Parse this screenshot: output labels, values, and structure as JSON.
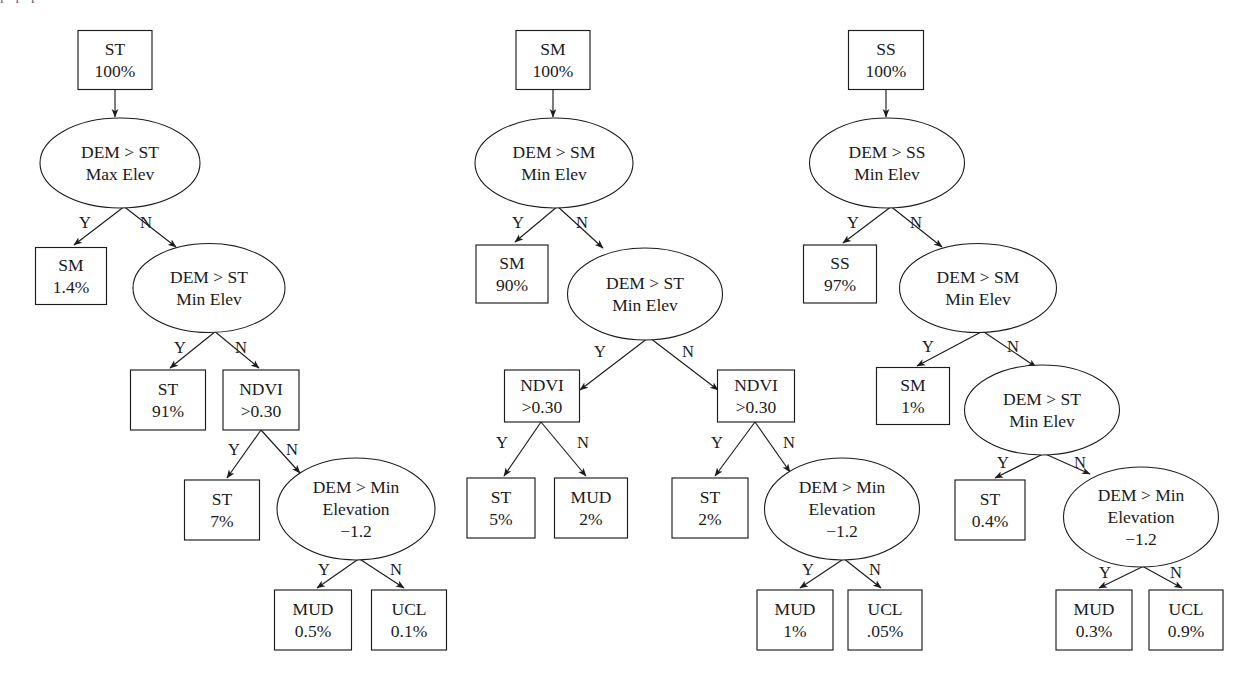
{
  "figure": {
    "clipped_header_text": "p            p                                 p",
    "colors": {
      "background": "#ffffff",
      "stroke": "#1c1c1c",
      "text": "#1a1a1a"
    }
  },
  "trees": [
    {
      "id": "tree-st",
      "root_label": "ST",
      "nodes": [
        {
          "id": "t1-n1",
          "shape": "rect",
          "line1": "ST",
          "line2": "100%",
          "line3": "",
          "cx": 115,
          "cy": 60,
          "w": 74,
          "h": 59
        },
        {
          "id": "t1-n2",
          "shape": "ellipse",
          "line1": "DEM > ST",
          "line2": "Max Elev",
          "line3": "",
          "cx": 120,
          "cy": 163,
          "w": 160,
          "h": 90
        },
        {
          "id": "t1-n3",
          "shape": "rect",
          "line1": "SM",
          "line2": "1.4%",
          "line3": "",
          "cx": 71,
          "cy": 276,
          "w": 71,
          "h": 57
        },
        {
          "id": "t1-n4",
          "shape": "ellipse",
          "line1": "DEM > ST",
          "line2": "Min Elev",
          "line3": "",
          "cx": 209,
          "cy": 288,
          "w": 152,
          "h": 89
        },
        {
          "id": "t1-n5",
          "shape": "rect",
          "line1": "ST",
          "line2": "91%",
          "line3": "",
          "cx": 168,
          "cy": 400,
          "w": 75,
          "h": 60
        },
        {
          "id": "t1-n6",
          "shape": "rect",
          "line1": "NDVI",
          "line2": ">0.30",
          "line3": "",
          "cx": 261,
          "cy": 400,
          "w": 76,
          "h": 60
        },
        {
          "id": "t1-n7",
          "shape": "rect",
          "line1": "ST",
          "line2": "7%",
          "line3": "",
          "cx": 222,
          "cy": 510,
          "w": 75,
          "h": 60
        },
        {
          "id": "t1-n8",
          "shape": "ellipse",
          "line1": "DEM > Min",
          "line2": "Elevation",
          "line3": "−1.2",
          "cx": 356,
          "cy": 509,
          "w": 158,
          "h": 102
        },
        {
          "id": "t1-n9",
          "shape": "rect",
          "line1": "MUD",
          "line2": "0.5%",
          "line3": "",
          "cx": 313,
          "cy": 620,
          "w": 77,
          "h": 60
        },
        {
          "id": "t1-n10",
          "shape": "rect",
          "line1": "UCL",
          "line2": "0.1%",
          "line3": "",
          "cx": 409,
          "cy": 620,
          "w": 75,
          "h": 60
        }
      ],
      "edges": [
        {
          "from": "t1-n1",
          "to": "t1-n2",
          "label": "",
          "x1": 115,
          "y1": 90,
          "x2": 115,
          "y2": 117,
          "lx": 0,
          "ly": 0
        },
        {
          "from": "t1-n2",
          "to": "t1-n3",
          "label": "Y",
          "x1": 125,
          "y1": 206,
          "x2": 74,
          "y2": 245,
          "lx": 85,
          "ly": 228
        },
        {
          "from": "t1-n2",
          "to": "t1-n4",
          "label": "N",
          "x1": 122,
          "y1": 205,
          "x2": 176,
          "y2": 247,
          "lx": 146,
          "ly": 228
        },
        {
          "from": "t1-n4",
          "to": "t1-n5",
          "label": "Y",
          "x1": 216,
          "y1": 331,
          "x2": 170,
          "y2": 368,
          "lx": 180,
          "ly": 353
        },
        {
          "from": "t1-n4",
          "to": "t1-n6",
          "label": "N",
          "x1": 213,
          "y1": 330,
          "x2": 259,
          "y2": 368,
          "lx": 241,
          "ly": 353
        },
        {
          "from": "t1-n6",
          "to": "t1-n7",
          "label": "Y",
          "x1": 261,
          "y1": 430,
          "x2": 227,
          "y2": 478,
          "lx": 234,
          "ly": 455
        },
        {
          "from": "t1-n6",
          "to": "t1-n8",
          "label": "N",
          "x1": 261,
          "y1": 430,
          "x2": 300,
          "y2": 473,
          "lx": 292,
          "ly": 455
        },
        {
          "from": "t1-n8",
          "to": "t1-n9",
          "label": "Y",
          "x1": 360,
          "y1": 558,
          "x2": 317,
          "y2": 588,
          "lx": 324,
          "ly": 575
        },
        {
          "from": "t1-n8",
          "to": "t1-n10",
          "label": "N",
          "x1": 358,
          "y1": 558,
          "x2": 404,
          "y2": 588,
          "lx": 396,
          "ly": 575
        }
      ]
    },
    {
      "id": "tree-sm",
      "root_label": "SM",
      "nodes": [
        {
          "id": "t2-n1",
          "shape": "rect",
          "line1": "SM",
          "line2": "100%",
          "line3": "",
          "cx": 553,
          "cy": 60,
          "w": 74,
          "h": 59
        },
        {
          "id": "t2-n2",
          "shape": "ellipse",
          "line1": "DEM > SM",
          "line2": "Min Elev",
          "line3": "",
          "cx": 554,
          "cy": 163,
          "w": 158,
          "h": 90
        },
        {
          "id": "t2-n3",
          "shape": "rect",
          "line1": "SM",
          "line2": "90%",
          "line3": "",
          "cx": 512,
          "cy": 274,
          "w": 72,
          "h": 58
        },
        {
          "id": "t2-n4",
          "shape": "ellipse",
          "line1": "DEM > ST",
          "line2": "Min Elev",
          "line3": "",
          "cx": 645,
          "cy": 294,
          "w": 155,
          "h": 92
        },
        {
          "id": "t2-n5",
          "shape": "rect",
          "line1": "NDVI",
          "line2": ">0.30",
          "line3": "",
          "cx": 542,
          "cy": 396,
          "w": 75,
          "h": 52
        },
        {
          "id": "t2-n6",
          "shape": "rect",
          "line1": "NDVI",
          "line2": ">0.30",
          "line3": "",
          "cx": 756,
          "cy": 396,
          "w": 77,
          "h": 52
        },
        {
          "id": "t2-n7",
          "shape": "rect",
          "line1": "ST",
          "line2": "5%",
          "line3": "",
          "cx": 501,
          "cy": 508,
          "w": 68,
          "h": 60
        },
        {
          "id": "t2-n8",
          "shape": "rect",
          "line1": "MUD",
          "line2": "2%",
          "line3": "",
          "cx": 591,
          "cy": 508,
          "w": 73,
          "h": 60
        },
        {
          "id": "t2-n9",
          "shape": "rect",
          "line1": "ST",
          "line2": "2%",
          "line3": "",
          "cx": 710,
          "cy": 508,
          "w": 76,
          "h": 60
        },
        {
          "id": "t2-n10",
          "shape": "ellipse",
          "line1": "DEM > Min",
          "line2": "Elevation",
          "line3": "−1.2",
          "cx": 842,
          "cy": 509,
          "w": 155,
          "h": 102
        },
        {
          "id": "t2-n11",
          "shape": "rect",
          "line1": "MUD",
          "line2": "1%",
          "line3": "",
          "cx": 795,
          "cy": 620,
          "w": 76,
          "h": 60
        },
        {
          "id": "t2-n12",
          "shape": "rect",
          "line1": "UCL",
          "line2": ".05%",
          "line3": "",
          "cx": 885,
          "cy": 620,
          "w": 74,
          "h": 60
        }
      ],
      "edges": [
        {
          "from": "t2-n1",
          "to": "t2-n2",
          "label": "",
          "x1": 553,
          "y1": 90,
          "x2": 553,
          "y2": 117,
          "lx": 0,
          "ly": 0
        },
        {
          "from": "t2-n2",
          "to": "t2-n3",
          "label": "Y",
          "x1": 558,
          "y1": 206,
          "x2": 515,
          "y2": 242,
          "lx": 518,
          "ly": 228
        },
        {
          "from": "t2-n2",
          "to": "t2-n4",
          "label": "N",
          "x1": 556,
          "y1": 205,
          "x2": 603,
          "y2": 248,
          "lx": 582,
          "ly": 228
        },
        {
          "from": "t2-n4",
          "to": "t2-n5",
          "label": "Y",
          "x1": 648,
          "y1": 338,
          "x2": 580,
          "y2": 390,
          "lx": 600,
          "ly": 357
        },
        {
          "from": "t2-n4",
          "to": "t2-n6",
          "label": "N",
          "x1": 650,
          "y1": 338,
          "x2": 718,
          "y2": 390,
          "lx": 688,
          "ly": 357
        },
        {
          "from": "t2-n5",
          "to": "t2-n7",
          "label": "Y",
          "x1": 541,
          "y1": 422,
          "x2": 504,
          "y2": 476,
          "lx": 502,
          "ly": 448
        },
        {
          "from": "t2-n5",
          "to": "t2-n8",
          "label": "N",
          "x1": 541,
          "y1": 422,
          "x2": 586,
          "y2": 476,
          "lx": 583,
          "ly": 448
        },
        {
          "from": "t2-n6",
          "to": "t2-n9",
          "label": "Y",
          "x1": 755,
          "y1": 422,
          "x2": 715,
          "y2": 476,
          "lx": 717,
          "ly": 448
        },
        {
          "from": "t2-n6",
          "to": "t2-n10",
          "label": "N",
          "x1": 755,
          "y1": 422,
          "x2": 790,
          "y2": 472,
          "lx": 789,
          "ly": 448
        },
        {
          "from": "t2-n10",
          "to": "t2-n11",
          "label": "Y",
          "x1": 845,
          "y1": 558,
          "x2": 800,
          "y2": 588,
          "lx": 808,
          "ly": 575
        },
        {
          "from": "t2-n10",
          "to": "t2-n12",
          "label": "N",
          "x1": 843,
          "y1": 558,
          "x2": 881,
          "y2": 588,
          "lx": 875,
          "ly": 575
        }
      ]
    },
    {
      "id": "tree-ss",
      "root_label": "SS",
      "nodes": [
        {
          "id": "t3-n1",
          "shape": "rect",
          "line1": "SS",
          "line2": "100%",
          "line3": "",
          "cx": 886,
          "cy": 60,
          "w": 75,
          "h": 59
        },
        {
          "id": "t3-n2",
          "shape": "ellipse",
          "line1": "DEM > SS",
          "line2": "Min Elev",
          "line3": "",
          "cx": 887,
          "cy": 163,
          "w": 155,
          "h": 90
        },
        {
          "id": "t3-n3",
          "shape": "rect",
          "line1": "SS",
          "line2": "97%",
          "line3": "",
          "cx": 840,
          "cy": 274,
          "w": 73,
          "h": 58
        },
        {
          "id": "t3-n4",
          "shape": "ellipse",
          "line1": "DEM > SM",
          "line2": "Min Elev",
          "line3": "",
          "cx": 978,
          "cy": 288,
          "w": 157,
          "h": 89
        },
        {
          "id": "t3-n5",
          "shape": "rect",
          "line1": "SM",
          "line2": "1%",
          "line3": "",
          "cx": 913,
          "cy": 396,
          "w": 73,
          "h": 57
        },
        {
          "id": "t3-n6",
          "shape": "ellipse",
          "line1": "DEM > ST",
          "line2": "Min Elev",
          "line3": "",
          "cx": 1042,
          "cy": 410,
          "w": 155,
          "h": 90
        },
        {
          "id": "t3-n7",
          "shape": "rect",
          "line1": "ST",
          "line2": "0.4%",
          "line3": "",
          "cx": 990,
          "cy": 510,
          "w": 70,
          "h": 60
        },
        {
          "id": "t3-n8",
          "shape": "ellipse",
          "line1": "DEM > Min",
          "line2": "Elevation",
          "line3": "−1.2",
          "cx": 1141,
          "cy": 517,
          "w": 155,
          "h": 100
        },
        {
          "id": "t3-n9",
          "shape": "rect",
          "line1": "MUD",
          "line2": "0.3%",
          "line3": "",
          "cx": 1094,
          "cy": 620,
          "w": 76,
          "h": 60
        },
        {
          "id": "t3-n10",
          "shape": "rect",
          "line1": "UCL",
          "line2": "0.9%",
          "line3": "",
          "cx": 1186,
          "cy": 620,
          "w": 74,
          "h": 60
        }
      ],
      "edges": [
        {
          "from": "t3-n1",
          "to": "t3-n2",
          "label": "",
          "x1": 886,
          "y1": 90,
          "x2": 886,
          "y2": 117,
          "lx": 0,
          "ly": 0
        },
        {
          "from": "t3-n2",
          "to": "t3-n3",
          "label": "Y",
          "x1": 892,
          "y1": 206,
          "x2": 843,
          "y2": 243,
          "lx": 853,
          "ly": 228
        },
        {
          "from": "t3-n2",
          "to": "t3-n4",
          "label": "N",
          "x1": 889,
          "y1": 205,
          "x2": 942,
          "y2": 247,
          "lx": 916,
          "ly": 228
        },
        {
          "from": "t3-n4",
          "to": "t3-n5",
          "label": "Y",
          "x1": 983,
          "y1": 331,
          "x2": 917,
          "y2": 366,
          "lx": 928,
          "ly": 352
        },
        {
          "from": "t3-n4",
          "to": "t3-n6",
          "label": "N",
          "x1": 981,
          "y1": 330,
          "x2": 1036,
          "y2": 367,
          "lx": 1013,
          "ly": 352
        },
        {
          "from": "t3-n6",
          "to": "t3-n7",
          "label": "Y",
          "x1": 1045,
          "y1": 453,
          "x2": 995,
          "y2": 478,
          "lx": 1003,
          "ly": 468
        },
        {
          "from": "t3-n6",
          "to": "t3-n8",
          "label": "N",
          "x1": 1043,
          "y1": 453,
          "x2": 1090,
          "y2": 474,
          "lx": 1080,
          "ly": 468
        },
        {
          "from": "t3-n8",
          "to": "t3-n9",
          "label": "Y",
          "x1": 1144,
          "y1": 566,
          "x2": 1099,
          "y2": 588,
          "lx": 1105,
          "ly": 578
        },
        {
          "from": "t3-n8",
          "to": "t3-n10",
          "label": "N",
          "x1": 1142,
          "y1": 566,
          "x2": 1182,
          "y2": 588,
          "lx": 1176,
          "ly": 578
        }
      ]
    }
  ]
}
